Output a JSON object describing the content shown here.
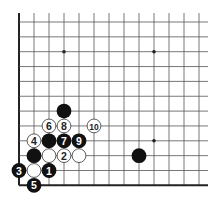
{
  "diagram": {
    "type": "go-board-corner",
    "grid": {
      "origin_x": 19,
      "origin_y": 22,
      "spacing_x": 15,
      "spacing_y": 14.85,
      "cols": 13,
      "rows": 12,
      "top_extend_y": 13,
      "right_extend_x": 208,
      "left_edge": true,
      "bottom_edge": true
    },
    "colors": {
      "line": "#555555",
      "edge": "#222222",
      "black_stone": "#111111",
      "white_stone": "#ffffff",
      "white_stone_border": "#333333"
    },
    "star_points": [
      {
        "c": 3,
        "r": 2
      },
      {
        "c": 9,
        "r": 2
      },
      {
        "c": 9,
        "r": 8
      }
    ],
    "stones": [
      {
        "c": 3,
        "r": 6,
        "color": "black",
        "label": ""
      },
      {
        "c": 2,
        "r": 7,
        "color": "white",
        "label": "6"
      },
      {
        "c": 3,
        "r": 7,
        "color": "white",
        "label": "8"
      },
      {
        "c": 5,
        "r": 7,
        "color": "white",
        "label": "10"
      },
      {
        "c": 1,
        "r": 8,
        "color": "white",
        "label": "4"
      },
      {
        "c": 2,
        "r": 8,
        "color": "black",
        "label": ""
      },
      {
        "c": 3,
        "r": 8,
        "color": "black",
        "label": "7"
      },
      {
        "c": 4,
        "r": 8,
        "color": "black",
        "label": "9"
      },
      {
        "c": 1,
        "r": 9,
        "color": "black",
        "label": ""
      },
      {
        "c": 2,
        "r": 9,
        "color": "white",
        "label": ""
      },
      {
        "c": 3,
        "r": 9,
        "color": "white",
        "label": "2"
      },
      {
        "c": 4,
        "r": 9,
        "color": "white",
        "label": ""
      },
      {
        "c": 8,
        "r": 9,
        "color": "black",
        "label": ""
      },
      {
        "c": 0,
        "r": 10,
        "color": "black",
        "label": "3"
      },
      {
        "c": 1,
        "r": 10,
        "color": "white",
        "label": ""
      },
      {
        "c": 2,
        "r": 10,
        "color": "black",
        "label": "1"
      },
      {
        "c": 1,
        "r": 11,
        "color": "black",
        "label": "5"
      }
    ]
  }
}
